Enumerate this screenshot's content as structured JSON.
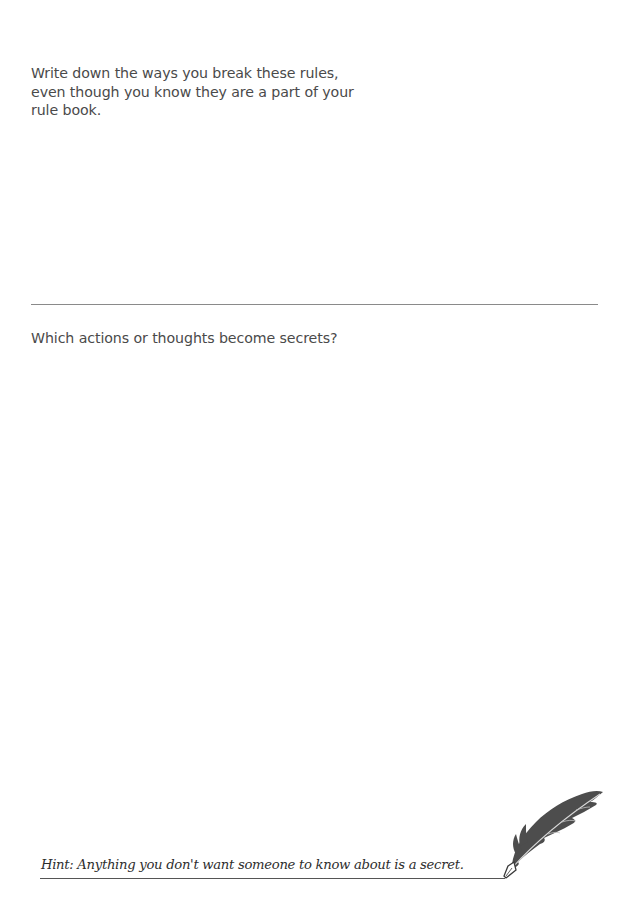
{
  "worksheet": {
    "section_1": {
      "prompt": "Write down the ways you break these rules, even though you know they are a part of your rule book."
    },
    "section_2": {
      "prompt": "Which actions or thoughts become secrets?"
    },
    "hint": {
      "text": "Hint: Anything you don't want someone to know about is a secret."
    },
    "decoration": {
      "icon": "quill-feather-icon"
    },
    "colors": {
      "text": "#4a4a4a",
      "hint_text": "#2e2e2e",
      "divider": "#8a8a8a",
      "feather": "#4d4d4d"
    }
  }
}
